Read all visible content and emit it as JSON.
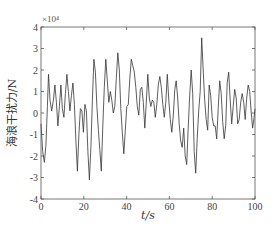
{
  "chart_data": {
    "type": "line",
    "title": "",
    "xlabel": "t/s",
    "ylabel": "海浪干扰力/N",
    "y_multiplier": "×10⁴",
    "xlim": [
      0,
      100
    ],
    "ylim": [
      -4,
      4
    ],
    "x_ticks": [
      0,
      20,
      40,
      60,
      80,
      100
    ],
    "y_ticks": [
      -4,
      -3,
      -2,
      -1,
      0,
      1,
      2,
      3,
      4
    ],
    "grid": false,
    "legend": null,
    "series": [
      {
        "name": "wave disturbance force",
        "color": "#333333",
        "x": [
          0,
          0.8,
          1.6,
          2.3,
          3.0,
          3.5,
          4.2,
          5.0,
          5.8,
          6.5,
          7.2,
          7.9,
          8.6,
          9.3,
          10.0,
          10.7,
          11.4,
          12.1,
          12.8,
          13.5,
          14.2,
          14.9,
          15.6,
          16.3,
          17.0,
          17.7,
          18.4,
          19.1,
          19.8,
          20.5,
          21.2,
          21.9,
          22.6,
          23.3,
          24.0,
          24.7,
          25.4,
          26.1,
          26.8,
          27.5,
          28.2,
          28.9,
          29.6,
          30.3,
          31.0,
          31.7,
          32.4,
          33.1,
          33.8,
          34.5,
          35.2,
          35.9,
          36.6,
          37.3,
          38.0,
          38.7,
          39.4,
          40.1,
          40.8,
          41.5,
          42.2,
          42.9,
          43.6,
          44.3,
          45.0,
          45.7,
          46.4,
          47.1,
          47.8,
          48.5,
          49.2,
          49.9,
          50.6,
          51.3,
          52.0,
          52.7,
          53.4,
          54.1,
          54.8,
          55.5,
          56.2,
          56.9,
          57.6,
          58.3,
          59.0,
          59.7,
          60.4,
          61.1,
          61.8,
          62.5,
          63.2,
          63.9,
          64.6,
          65.3,
          66.0,
          66.7,
          67.4,
          68.1,
          68.8,
          69.5,
          70.2,
          70.9,
          71.6,
          72.3,
          73.0,
          73.7,
          74.4,
          75.1,
          75.8,
          76.5,
          77.2,
          77.9,
          78.6,
          79.3,
          80.0,
          80.7,
          81.4,
          82.1,
          82.8,
          83.5,
          84.2,
          84.9,
          85.6,
          86.3,
          87.0,
          87.7,
          88.4,
          89.1,
          89.8,
          90.5,
          91.2,
          91.9,
          92.6,
          93.3,
          94.0,
          94.7,
          95.4,
          96.1,
          96.8,
          97.5,
          98.2,
          98.9,
          99.6,
          100
        ],
        "y": [
          -0.5,
          -1.8,
          -2.3,
          -1.5,
          0.3,
          1.8,
          0.6,
          0.1,
          0.6,
          1.3,
          0.5,
          -0.6,
          0.3,
          1.3,
          0.2,
          -0.2,
          0.9,
          1.8,
          1.0,
          0.1,
          0.8,
          1.4,
          0.4,
          -1.3,
          -2.7,
          -1.0,
          0.2,
          0.1,
          -0.9,
          0.4,
          0.1,
          -1.8,
          -3.1,
          -1.6,
          0.6,
          2.5,
          1.9,
          0.3,
          -0.8,
          -1.7,
          -2.7,
          -0.6,
          1.2,
          2.5,
          1.5,
          0.5,
          1.0,
          0.6,
          0.0,
          0.3,
          1.6,
          2.8,
          2.0,
          0.2,
          -0.9,
          -1.9,
          -0.8,
          0.3,
          0.4,
          1.6,
          2.5,
          2.2,
          1.9,
          1.2,
          0.3,
          -0.1,
          1.1,
          1.2,
          0.5,
          -0.7,
          0.5,
          1.8,
          0.7,
          0.3,
          0.6,
          0.5,
          -0.2,
          0.4,
          1.3,
          1.7,
          1.2,
          0.4,
          -0.2,
          0.5,
          1.8,
          0.6,
          -0.3,
          -0.9,
          -0.1,
          1.1,
          1.5,
          0.7,
          -0.5,
          -1.3,
          -1.6,
          -0.7,
          -2.0,
          -2.4,
          -0.7,
          0.8,
          2.0,
          0.9,
          -1.8,
          -2.8,
          -1.2,
          0.1,
          1.0,
          3.5,
          2.0,
          0.6,
          -0.3,
          -0.8,
          1.3,
          0.8,
          -0.2,
          -0.6,
          -0.6,
          -1.2,
          0.2,
          1.5,
          0.9,
          -0.4,
          -1.2,
          -0.6,
          1.4,
          1.9,
          0.6,
          -0.5,
          0.3,
          1.1,
          0.7,
          -0.5,
          -0.3,
          0.5,
          0.9,
          0.5,
          -0.3,
          0.7,
          1.3,
          1.0,
          0.1,
          -0.7,
          -0.2,
          0.2
        ]
      }
    ]
  }
}
